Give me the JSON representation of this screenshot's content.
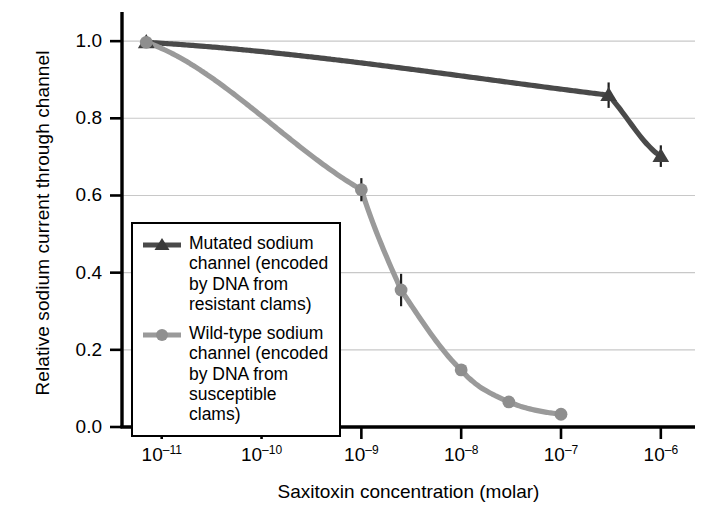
{
  "chart_data": {
    "type": "line",
    "title": "",
    "xlabel": "Saxitoxin concentration (molar)",
    "ylabel": "Relative sodium current through channel",
    "xscale": "log",
    "xlim": [
      4e-12,
      2.2e-06
    ],
    "ylim": [
      0.0,
      1.06
    ],
    "grid": "horizontal",
    "legend_position": "lower-left-inside",
    "xtick_labels": [
      "10⁻¹¹",
      "10⁻¹⁰",
      "10⁻⁹",
      "10⁻⁸",
      "10⁻⁷",
      "10⁻⁶"
    ],
    "xtick_mantissa": [
      "10",
      "10",
      "10",
      "10",
      "10",
      "10"
    ],
    "xtick_exponent": [
      "-11",
      "-10",
      "-9",
      "-8",
      "-7",
      "-6"
    ],
    "xtick_values": [
      1e-11,
      1e-10,
      1e-09,
      1e-08,
      1e-07,
      1e-06
    ],
    "ytick_labels": [
      "0.0",
      "0.2",
      "0.4",
      "0.6",
      "0.8",
      "1.0"
    ],
    "ytick_values": [
      0.0,
      0.2,
      0.4,
      0.6,
      0.8,
      1.0
    ],
    "series": [
      {
        "name": "Mutated sodium channel (encoded by DNA from resistant clams)",
        "short_name": "mutated",
        "color": "#4a4a4a",
        "marker": "triangle",
        "x": [
          7e-12,
          3e-07,
          1e-06
        ],
        "y": [
          0.997,
          0.86,
          0.702
        ],
        "yerr": [
          0.0,
          0.033,
          0.028
        ]
      },
      {
        "name": "Wild-type sodium channel (encoded by DNA from susceptible clams)",
        "short_name": "wild-type",
        "color": "#9a9a9a",
        "marker": "circle",
        "x": [
          7e-12,
          1e-09,
          2.5e-09,
          1e-08,
          3e-08,
          1e-07
        ],
        "y": [
          0.997,
          0.615,
          0.355,
          0.148,
          0.065,
          0.033
        ],
        "yerr": [
          0.0,
          0.03,
          0.042,
          0.0,
          0.0,
          0.0
        ]
      }
    ]
  },
  "legend": {
    "entries": [
      {
        "label": "Mutated sodium channel (encoded by DNA from resistant clams)",
        "marker": "triangle-marker",
        "color": "#4a4a4a"
      },
      {
        "label": "Wild-type sodium channel (encoded by DNA from susceptible clams)",
        "marker": "circle-marker",
        "color": "#9a9a9a"
      }
    ]
  },
  "style": {
    "axis_color": "#000000",
    "grid_color": "#c8c8c8",
    "background": "#ffffff"
  }
}
